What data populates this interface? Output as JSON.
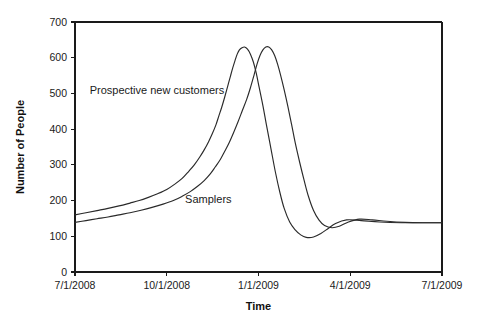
{
  "chart_data": {
    "type": "line",
    "title": "",
    "xlabel": "Time",
    "ylabel": "Number of People",
    "grid": false,
    "legend_position": "inline-annotation",
    "xlim": [
      "7/1/2008",
      "7/1/2009"
    ],
    "ylim": [
      0,
      700
    ],
    "yticks": [
      0,
      100,
      200,
      300,
      400,
      500,
      600,
      700
    ],
    "ytick_labels": [
      "0",
      "100",
      "200",
      "300",
      "400",
      "500",
      "600",
      "700"
    ],
    "xticks": [
      "7/1/2008",
      "10/1/2008",
      "1/1/2009",
      "4/1/2009",
      "7/1/2009"
    ],
    "xtick_labels": [
      "7/1/2008",
      "10/1/2008",
      "1/1/2009",
      "4/1/2009",
      "7/1/2009"
    ],
    "x_fraction": [
      0,
      0.25,
      0.5,
      0.75,
      1.0
    ],
    "annotations": [
      {
        "text": "Prospective new customers",
        "x_fraction": 0.04,
        "value": 510
      },
      {
        "text": "Samplers",
        "x_fraction": 0.3,
        "value": 205
      }
    ],
    "series": [
      {
        "name": "Prospective new customers",
        "color": "#2a2a2a",
        "x_fraction": [
          0.0,
          0.03,
          0.06,
          0.09,
          0.12,
          0.15,
          0.175,
          0.2,
          0.225,
          0.25,
          0.272,
          0.292,
          0.31,
          0.325,
          0.34,
          0.352,
          0.364,
          0.374,
          0.384,
          0.392,
          0.4,
          0.408,
          0.416,
          0.424,
          0.43,
          0.436,
          0.442,
          0.448,
          0.455,
          0.462,
          0.47,
          0.478,
          0.486,
          0.494,
          0.502,
          0.512,
          0.522,
          0.534,
          0.546,
          0.558,
          0.57,
          0.585,
          0.6,
          0.615,
          0.63,
          0.65,
          0.67,
          0.69,
          0.71,
          0.74,
          0.78,
          0.83,
          0.89,
          0.95,
          1.0
        ],
        "values": [
          160,
          166,
          172,
          178,
          185,
          193,
          200,
          209,
          219,
          231,
          246,
          262,
          282,
          300,
          322,
          342,
          365,
          387,
          412,
          437,
          462,
          490,
          520,
          550,
          572,
          592,
          610,
          622,
          628,
          630,
          624,
          610,
          588,
          556,
          516,
          466,
          410,
          345,
          280,
          224,
          178,
          140,
          118,
          104,
          97,
          98,
          108,
          122,
          136,
          146,
          144,
          140,
          138,
          138,
          138
        ]
      },
      {
        "name": "Samplers",
        "color": "#2a2a2a",
        "x_fraction": [
          0.0,
          0.03,
          0.06,
          0.09,
          0.12,
          0.15,
          0.18,
          0.21,
          0.24,
          0.268,
          0.292,
          0.314,
          0.334,
          0.352,
          0.368,
          0.382,
          0.396,
          0.408,
          0.42,
          0.432,
          0.444,
          0.456,
          0.468,
          0.478,
          0.488,
          0.496,
          0.504,
          0.512,
          0.52,
          0.528,
          0.536,
          0.544,
          0.552,
          0.56,
          0.57,
          0.58,
          0.59,
          0.6,
          0.612,
          0.624,
          0.636,
          0.65,
          0.665,
          0.68,
          0.7,
          0.72,
          0.745,
          0.775,
          0.81,
          0.85,
          0.9,
          0.95,
          1.0
        ],
        "values": [
          139,
          144,
          149,
          154,
          160,
          166,
          173,
          181,
          190,
          200,
          212,
          225,
          240,
          256,
          274,
          294,
          315,
          338,
          362,
          390,
          420,
          452,
          484,
          516,
          552,
          582,
          606,
          622,
          630,
          630,
          622,
          606,
          582,
          552,
          510,
          464,
          414,
          362,
          308,
          258,
          212,
          172,
          145,
          130,
          124,
          128,
          140,
          148,
          146,
          142,
          139,
          138,
          138
        ]
      }
    ]
  },
  "geometry": {
    "plot_left": 75,
    "plot_right": 442,
    "plot_top": 22,
    "plot_bottom": 272
  }
}
